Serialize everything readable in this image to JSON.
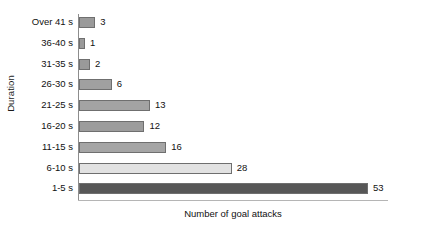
{
  "chart_data": {
    "type": "bar",
    "orientation": "horizontal",
    "title": "",
    "xlabel": "Number of goal attacks",
    "ylabel": "Duration",
    "categories": [
      "Over 41 s",
      "36-40 s",
      "31-35 s",
      "26-30 s",
      "21-25 s",
      "16-20 s",
      "11-15 s",
      "6-10 s",
      "1-5 s"
    ],
    "values": [
      3,
      1,
      2,
      6,
      13,
      12,
      16,
      28,
      53
    ],
    "bar_colors": [
      "#9a9a9a",
      "#9a9a9a",
      "#9a9a9a",
      "#a0a0a0",
      "#a3a3a3",
      "#9c9c9c",
      "#a5a5a5",
      "#e2e2e2",
      "#575757"
    ],
    "bar_border_color": "#6f6f6f",
    "xlim": [
      0,
      53
    ],
    "grid": false,
    "legend": false,
    "axis_color": "#8d8d8d",
    "background": "#ffffff"
  }
}
